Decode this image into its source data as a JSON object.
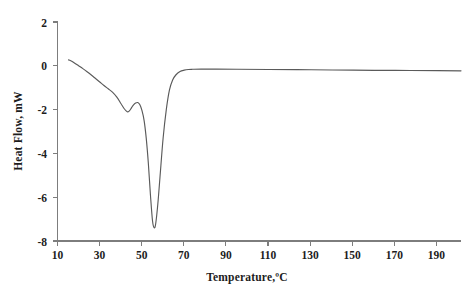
{
  "chart_data": {
    "type": "line",
    "title": "",
    "subtitle": "",
    "xlabel": "Temperature,ºC",
    "ylabel": "Heat Flow, mW",
    "xlim": [
      10,
      201
    ],
    "ylim": [
      -8,
      2
    ],
    "xticks": [
      10,
      30,
      50,
      70,
      90,
      110,
      130,
      150,
      170,
      190
    ],
    "yticks": [
      2,
      0,
      -2,
      -4,
      -6,
      -8
    ],
    "xtick_labels": [
      "10",
      "30",
      "50",
      "70",
      "90",
      "110",
      "130",
      "150",
      "170",
      "190"
    ],
    "ytick_labels": [
      "2",
      "0",
      "-2",
      "-4",
      "-6",
      "-8"
    ],
    "grid": false,
    "legend": null,
    "legend_position": "none",
    "annotations": [],
    "series": [
      {
        "name": "Heat Flow",
        "color": "#5a5a5a",
        "x": [
          15.2,
          16.5,
          18.0,
          20.0,
          22.0,
          24.0,
          26.0,
          28.0,
          30.0,
          32.0,
          34.0,
          36.0,
          38.0,
          40.0,
          41.5,
          43.0,
          44.0,
          45.0,
          46.0,
          47.0,
          48.0,
          49.0,
          50.0,
          51.0,
          52.0,
          53.0,
          54.0,
          55.0,
          55.8,
          56.5,
          57.5,
          58.5,
          60.0,
          61.5,
          63.0,
          64.5,
          66.0,
          68.0,
          70.0,
          72.0,
          74.0,
          78.0,
          85.0,
          95.0,
          110.0,
          130.0,
          150.0,
          170.0,
          190.0,
          201.0
        ],
        "y": [
          0.27,
          0.22,
          0.13,
          0.0,
          -0.13,
          -0.27,
          -0.42,
          -0.58,
          -0.74,
          -0.9,
          -1.05,
          -1.2,
          -1.42,
          -1.72,
          -1.95,
          -2.1,
          -2.06,
          -1.92,
          -1.78,
          -1.7,
          -1.68,
          -1.78,
          -2.05,
          -2.5,
          -3.3,
          -4.45,
          -5.9,
          -7.1,
          -7.4,
          -7.2,
          -6.3,
          -5.1,
          -3.3,
          -2.0,
          -1.1,
          -0.65,
          -0.42,
          -0.26,
          -0.2,
          -0.17,
          -0.16,
          -0.15,
          -0.15,
          -0.16,
          -0.17,
          -0.18,
          -0.2,
          -0.21,
          -0.22,
          -0.23
        ],
        "peaks": [
          {
            "type": "local_minimum",
            "x": 43.0,
            "y": -2.1,
            "label": "first endotherm"
          },
          {
            "type": "local_maximum",
            "x": 48.0,
            "y": -1.68,
            "label": "shoulder"
          },
          {
            "type": "global_minimum",
            "x": 55.8,
            "y": -7.4,
            "label": "main endotherm"
          }
        ]
      }
    ]
  },
  "figure": {
    "background_color": "#ffffff",
    "axis_color": "#7d7d7d",
    "text_color": "#1d1d1d"
  }
}
